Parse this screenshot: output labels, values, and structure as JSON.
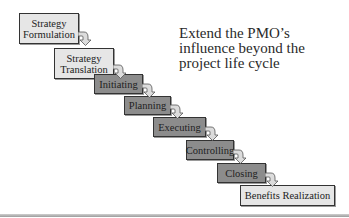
{
  "diagram": {
    "steps": [
      {
        "label": "Strategy Formulation",
        "lines": [
          "Strategy",
          "Formulation"
        ],
        "style": "light"
      },
      {
        "label": "Strategy Translation",
        "lines": [
          "Strategy",
          "Translation"
        ],
        "style": "light"
      },
      {
        "label": "Initiating",
        "lines": [
          "Initiating"
        ],
        "style": "dark"
      },
      {
        "label": "Planning",
        "lines": [
          "Planning"
        ],
        "style": "dark"
      },
      {
        "label": "Executing",
        "lines": [
          "Executing"
        ],
        "style": "dark"
      },
      {
        "label": "Controlling",
        "lines": [
          "Controlling"
        ],
        "style": "dark"
      },
      {
        "label": "Closing",
        "lines": [
          "Closing"
        ],
        "style": "dark"
      },
      {
        "label": "Benefits Realization",
        "lines": [
          "Benefits Realization"
        ],
        "style": "light"
      }
    ],
    "callout": "Extend the PMO’s\ninfluence beyond the\nproject life cycle",
    "colors": {
      "light_fill": "#e6e6e6",
      "dark_fill": "#8c8c8c",
      "border": "#333333",
      "arrow": "#dcdcdc"
    }
  }
}
